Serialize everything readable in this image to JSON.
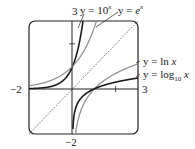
{
  "chart_data": {
    "type": "line",
    "title": "",
    "xlabel": "",
    "ylabel": "",
    "xlim": [
      -2,
      3
    ],
    "ylim": [
      -2,
      3
    ],
    "grid": false,
    "tick_labels": {
      "x_min": "−2",
      "x_max": "3",
      "y_min": "−2",
      "y_max": "3"
    },
    "series": [
      {
        "name": "y = 10^x",
        "label": "y = 10ˣ",
        "style": "dark",
        "function": "10^x"
      },
      {
        "name": "y = e^x",
        "label": "y = eˣ",
        "style": "gray",
        "function": "e^x"
      },
      {
        "name": "y = ln x",
        "label": "y = ln x",
        "style": "gray",
        "function": "ln(x)"
      },
      {
        "name": "y = log10 x",
        "label": "y = log₁₀ x",
        "style": "dark",
        "function": "log10(x)"
      },
      {
        "name": "y = x",
        "label": "",
        "style": "dotted",
        "function": "x"
      }
    ],
    "annotations": [
      "y = 10ˣ",
      "y = eˣ",
      "y = ln x",
      "y = log₁₀ x"
    ]
  },
  "labels": {
    "y_top": "3",
    "y_bottom": "−2",
    "x_left": "−2",
    "x_right": "3",
    "ten_x_prefix": "y = 10",
    "ten_x_sup": "x",
    "e_x_prefix": "y = ",
    "e_x_base": "e",
    "e_x_sup": "x",
    "ln_x": "y = ln ",
    "ln_x_var": "x",
    "log10_prefix": "y = log",
    "log10_sub": "10",
    "log10_var": "x"
  },
  "colors": {
    "dark": "#1a1a1a",
    "gray": "#8a8a8a",
    "frame": "#222222"
  }
}
